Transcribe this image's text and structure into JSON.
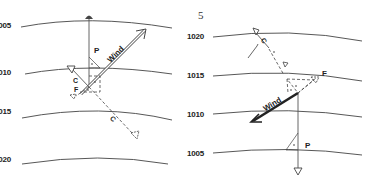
{
  "page_number": "5",
  "left_panel": {
    "isobars": [
      {
        "label": "1005"
      },
      {
        "label": "1010"
      },
      {
        "label": "1015"
      },
      {
        "label": "1020"
      }
    ],
    "vectors": {
      "wind": "Wind",
      "pressure": "P",
      "coriolis": "C",
      "coriolis_dashed": "C",
      "friction": "F"
    }
  },
  "right_panel": {
    "isobars": [
      {
        "label": "1020"
      },
      {
        "label": "1015"
      },
      {
        "label": "1010"
      },
      {
        "label": "1005"
      }
    ],
    "vectors": {
      "wind": "Wind",
      "pressure": "P",
      "coriolis": "C",
      "friction": "F"
    }
  }
}
